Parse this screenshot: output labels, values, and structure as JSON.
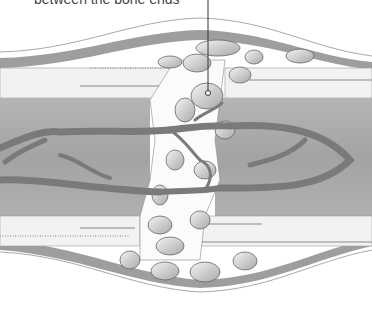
{
  "caption": "between the bone ends",
  "colors": {
    "background": "#ffffff",
    "outer_band": "#9a9a9a",
    "marrow": "#a8a8a8",
    "vessel": "#7d7d7d",
    "cortex": "#f0f0f0",
    "fragment": "#d6d6d6",
    "outline": "#555555",
    "pointer": "#333333"
  }
}
